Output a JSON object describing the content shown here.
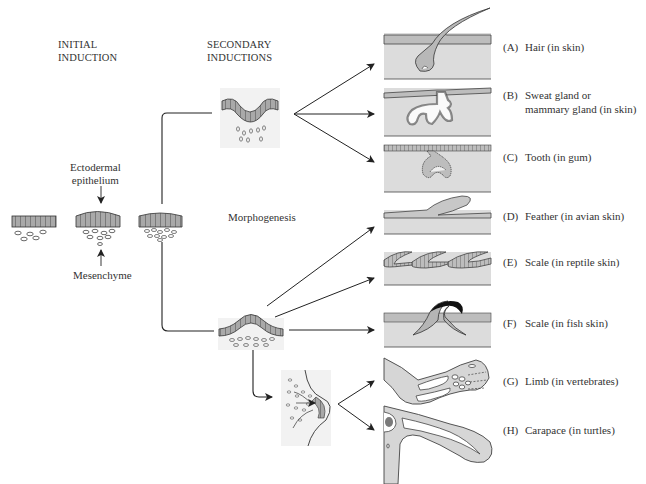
{
  "headings": {
    "initial": [
      "INITIAL",
      "INDUCTION"
    ],
    "secondary": [
      "SECONDARY",
      "INDUCTIONS"
    ]
  },
  "labels": {
    "ectodermal": [
      "Ectodermal",
      "epithelium"
    ],
    "mesenchyme": "Mesenchyme",
    "morphogenesis": "Morphogenesis"
  },
  "panels": [
    {
      "letter": "(A)",
      "text": [
        "Hair (in skin)"
      ]
    },
    {
      "letter": "(B)",
      "text": [
        "Sweat gland or",
        "mammary gland (in skin)"
      ]
    },
    {
      "letter": "(C)",
      "text": [
        "Tooth (in gum)"
      ]
    },
    {
      "letter": "(D)",
      "text": [
        "Feather (in avian skin)"
      ]
    },
    {
      "letter": "(E)",
      "text": [
        "Scale (in reptile skin)"
      ]
    },
    {
      "letter": "(F)",
      "text": [
        "Scale (in fish skin)"
      ]
    },
    {
      "letter": "(G)",
      "text": [
        "Limb (in vertebrates)"
      ]
    },
    {
      "letter": "(H)",
      "text": [
        "Carapace (in turtles)"
      ]
    }
  ],
  "colors": {
    "tissue": "#d6d6d6",
    "epithelium": "#a9a9a9",
    "line": "#2a2a2a",
    "panel_bg": "#dcdcdc"
  }
}
